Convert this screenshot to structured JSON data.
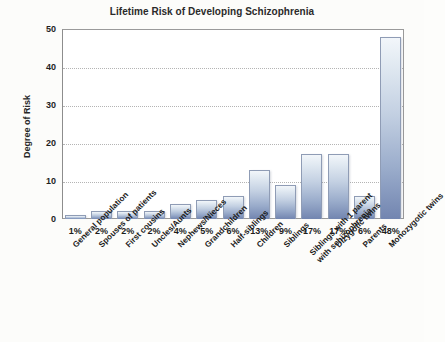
{
  "chart_data": {
    "type": "bar",
    "title": "Lifetime Risk of Developing Schizophrenia",
    "xlabel": "",
    "ylabel": "Degree of Risk",
    "ylim": [
      0,
      50
    ],
    "yticks": [
      0,
      10,
      20,
      30,
      40,
      50
    ],
    "grid": true,
    "legend": false,
    "categories": [
      "General population",
      "Spouses of patients",
      "First cousins",
      "Uncles/Aunts",
      "Nephews/Nieces",
      "Grandchildren",
      "Half-siblings",
      "Children",
      "Siblings",
      "Siblings with 1 parent with schizophrenia",
      "Dizygotic twins",
      "Parents",
      "Monozygotic twins"
    ],
    "values": [
      1,
      2,
      2,
      2,
      4,
      5,
      6,
      13,
      9,
      17,
      17,
      6,
      48
    ],
    "data_labels": [
      "1%",
      "2%",
      "2%",
      "2%",
      "4%",
      "5%",
      "6%",
      "13%",
      "9%",
      "17%",
      "17%",
      "6%",
      "48%"
    ],
    "bar_color_top": "#f2f6fa",
    "bar_color_bottom": "#7285b0",
    "bar_border_color": "#8f9cb5",
    "gridline_color": "#b4b4b4",
    "axis_color": "#9a9a9a",
    "background_color": "#fcfcfa",
    "text_color": "#1d1d1d"
  }
}
